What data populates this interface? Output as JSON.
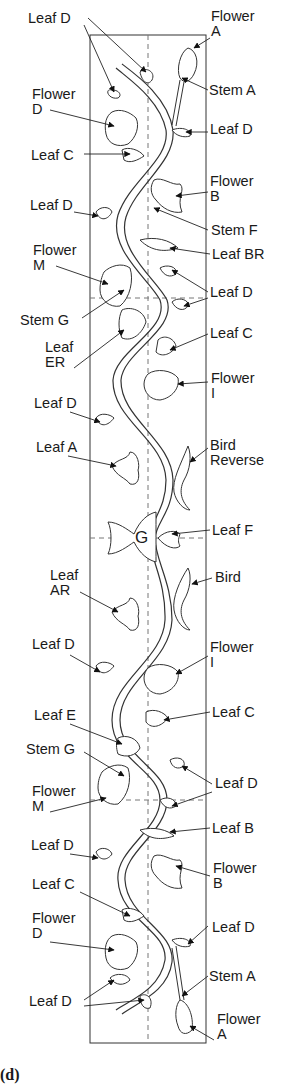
{
  "diagram": {
    "type": "embroidery-vine-pattern",
    "center_marker": "G",
    "colors": {
      "line": "#333333",
      "text": "#1a1a1a",
      "background": "#ffffff",
      "guide": "#777777"
    },
    "labels": [
      {
        "id": "l1",
        "text": "Leaf D",
        "x": 28,
        "y": 11,
        "side": "left"
      },
      {
        "id": "l2",
        "text": "Flower\nA",
        "x": 211,
        "y": 9,
        "side": "right"
      },
      {
        "id": "l3",
        "text": "Stem A",
        "x": 209,
        "y": 83,
        "side": "right"
      },
      {
        "id": "l4",
        "text": "Flower\nD",
        "x": 32,
        "y": 87,
        "side": "left"
      },
      {
        "id": "l5",
        "text": "Leaf D",
        "x": 210,
        "y": 122,
        "side": "right"
      },
      {
        "id": "l6",
        "text": "Leaf C",
        "x": 31,
        "y": 148,
        "side": "left"
      },
      {
        "id": "l7",
        "text": "Flower\nB",
        "x": 210,
        "y": 174,
        "side": "right"
      },
      {
        "id": "l8",
        "text": "Leaf D",
        "x": 30,
        "y": 198,
        "side": "left"
      },
      {
        "id": "l9",
        "text": "Stem F",
        "x": 211,
        "y": 223,
        "side": "right"
      },
      {
        "id": "l10",
        "text": "Leaf BR",
        "x": 212,
        "y": 247,
        "side": "right"
      },
      {
        "id": "l11",
        "text": "Flower\nM",
        "x": 33,
        "y": 243,
        "side": "left"
      },
      {
        "id": "l12",
        "text": "Leaf D",
        "x": 210,
        "y": 285,
        "side": "right"
      },
      {
        "id": "l13",
        "text": "Stem G",
        "x": 20,
        "y": 313,
        "side": "left"
      },
      {
        "id": "l14",
        "text": "Leaf C",
        "x": 210,
        "y": 326,
        "side": "right"
      },
      {
        "id": "l15",
        "text": "Leaf\nER",
        "x": 45,
        "y": 340,
        "side": "left"
      },
      {
        "id": "l16",
        "text": "Flower\nI",
        "x": 211,
        "y": 371,
        "side": "right"
      },
      {
        "id": "l17",
        "text": "Leaf D",
        "x": 34,
        "y": 396,
        "side": "left"
      },
      {
        "id": "l18",
        "text": "Leaf A",
        "x": 36,
        "y": 440,
        "side": "left"
      },
      {
        "id": "l19",
        "text": "Bird\nReverse",
        "x": 210,
        "y": 438,
        "side": "right"
      },
      {
        "id": "l20",
        "text": "Leaf F",
        "x": 212,
        "y": 523,
        "side": "right"
      },
      {
        "id": "l21",
        "text": "Leaf\nAR",
        "x": 50,
        "y": 568,
        "side": "left"
      },
      {
        "id": "l22",
        "text": "Bird",
        "x": 215,
        "y": 570,
        "side": "right"
      },
      {
        "id": "l23",
        "text": "Leaf D",
        "x": 32,
        "y": 637,
        "side": "left"
      },
      {
        "id": "l24",
        "text": "Flower\nI",
        "x": 210,
        "y": 640,
        "side": "right"
      },
      {
        "id": "l25",
        "text": "Leaf C",
        "x": 212,
        "y": 705,
        "side": "right"
      },
      {
        "id": "l26",
        "text": "Leaf E",
        "x": 34,
        "y": 708,
        "side": "left"
      },
      {
        "id": "l27",
        "text": "Stem G",
        "x": 26,
        "y": 742,
        "side": "left"
      },
      {
        "id": "l28",
        "text": "Leaf D",
        "x": 215,
        "y": 776,
        "side": "right"
      },
      {
        "id": "l29",
        "text": "Flower\nM",
        "x": 32,
        "y": 784,
        "side": "left"
      },
      {
        "id": "l30",
        "text": "Leaf B",
        "x": 212,
        "y": 821,
        "side": "right"
      },
      {
        "id": "l31",
        "text": "Leaf D",
        "x": 31,
        "y": 838,
        "side": "left"
      },
      {
        "id": "l32",
        "text": "Flower\nB",
        "x": 213,
        "y": 861,
        "side": "right"
      },
      {
        "id": "l33",
        "text": "Leaf C",
        "x": 32,
        "y": 877,
        "side": "left"
      },
      {
        "id": "l34",
        "text": "Flower\nD",
        "x": 32,
        "y": 911,
        "side": "left"
      },
      {
        "id": "l35",
        "text": "Leaf D",
        "x": 212,
        "y": 920,
        "side": "right"
      },
      {
        "id": "l36",
        "text": "Stem A",
        "x": 209,
        "y": 969,
        "side": "right"
      },
      {
        "id": "l37",
        "text": "Leaf D",
        "x": 29,
        "y": 994,
        "side": "left"
      },
      {
        "id": "l38",
        "text": "Flower\nA",
        "x": 217,
        "y": 1012,
        "side": "right"
      }
    ],
    "bottom_glyph": "(d)"
  }
}
